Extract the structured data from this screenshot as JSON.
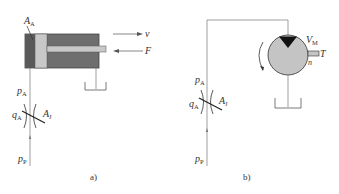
{
  "diagram_a": {
    "caption": "a)",
    "area_label": {
      "main": "A",
      "sub": "A"
    },
    "velocity_label": "v",
    "force_label": "F",
    "pressure_a": {
      "main": "p",
      "sub": "A"
    },
    "flow_a": {
      "main": "q",
      "sub": "A"
    },
    "throttle_area": {
      "main": "A",
      "sub": "J"
    },
    "pump_pressure": {
      "main": "p",
      "sub": "P"
    }
  },
  "diagram_b": {
    "caption": "b)",
    "displacement_label": {
      "main": "V",
      "sub": "M"
    },
    "torque_label": "T",
    "speed_label": "n",
    "pressure_a": {
      "main": "p",
      "sub": "A"
    },
    "flow_a": {
      "main": "q",
      "sub": "A"
    },
    "throttle_area": {
      "main": "A",
      "sub": "J"
    },
    "pump_pressure": {
      "main": "p",
      "sub": "P"
    }
  },
  "colors": {
    "cylinder_body": "#6e6e6e",
    "piston": "#c8c8c8",
    "rod": "#c8c8c8",
    "motor_fill": "#c4c4c4",
    "motor_triangle": "#111111",
    "line": "#666666"
  }
}
